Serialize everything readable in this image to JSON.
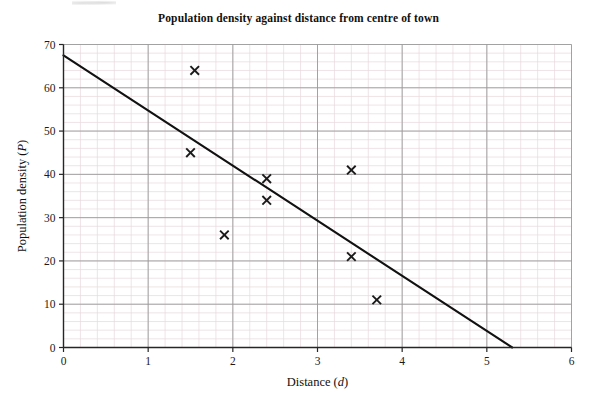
{
  "chart_data": {
    "type": "scatter",
    "title": "Population density against distance from centre of town",
    "xlabel": "Distance (d)",
    "xlabel_text": "Distance (",
    "xlabel_var": "d",
    "xlabel_tail": ")",
    "ylabel": "Population density (P)",
    "ylabel_text": "Population density (",
    "ylabel_var": "P",
    "ylabel_tail": ")",
    "xlim": [
      0,
      6
    ],
    "ylim": [
      0,
      70
    ],
    "xticks": [
      0,
      1,
      2,
      3,
      4,
      5,
      6
    ],
    "yticks": [
      0,
      10,
      20,
      30,
      40,
      50,
      60,
      70
    ],
    "xtick_labels": [
      "0",
      "1",
      "2",
      "3",
      "4",
      "5",
      "6"
    ],
    "ytick_labels": [
      "0",
      "10",
      "20",
      "30",
      "40",
      "50",
      "60",
      "70"
    ],
    "x_minor_step": 0.2,
    "y_minor_step": 2,
    "grid": true,
    "grid_major_color": "#9a9a9a",
    "grid_minor_color": "#e8d9dc",
    "marker": "x",
    "marker_color": "#1a1a1a",
    "legend": null,
    "points": [
      {
        "x": 1.55,
        "y": 64
      },
      {
        "x": 1.5,
        "y": 45
      },
      {
        "x": 1.9,
        "y": 26
      },
      {
        "x": 2.4,
        "y": 39
      },
      {
        "x": 2.4,
        "y": 34
      },
      {
        "x": 3.4,
        "y": 41
      },
      {
        "x": 3.4,
        "y": 21
      },
      {
        "x": 3.7,
        "y": 11
      }
    ],
    "series": [
      {
        "name": "Line of best fit",
        "type": "line",
        "color": "#111111",
        "x": [
          0,
          5.3
        ],
        "y": [
          67.5,
          0
        ]
      }
    ]
  }
}
